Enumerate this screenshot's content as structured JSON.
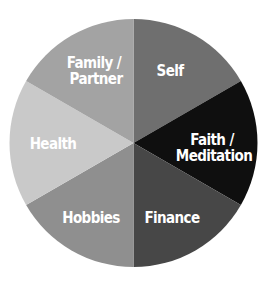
{
  "chart_data": {
    "type": "pie",
    "title": "",
    "start_angle_deg": 0,
    "direction": "clockwise",
    "categories": [
      "Self",
      "Faith / Meditation",
      "Finance",
      "Hobbies",
      "Health",
      "Family / Partner"
    ],
    "values": [
      1,
      1,
      1,
      1,
      1,
      1
    ],
    "colors": [
      "#6f6f6f",
      "#0f0f0f",
      "#474747",
      "#8f8f8f",
      "#c9c9c9",
      "#a3a3a3"
    ],
    "legend": "none",
    "labels_inside": true
  },
  "labels": {
    "self": [
      "Self"
    ],
    "faith": [
      "Faith /",
      "Meditation"
    ],
    "finance": [
      "Finance"
    ],
    "hobbies": [
      "Hobbies"
    ],
    "health": [
      "Health"
    ],
    "family": [
      "Family /",
      "Partner"
    ]
  }
}
